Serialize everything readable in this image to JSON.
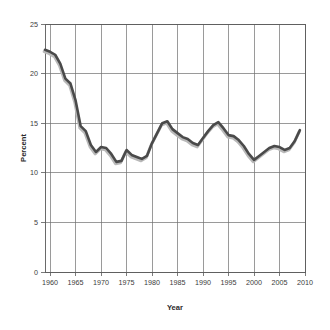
{
  "chart_data": {
    "type": "line",
    "title": "",
    "xlabel": "Year",
    "ylabel": "Percent",
    "xlim": [
      1959,
      2010
    ],
    "ylim": [
      0,
      25
    ],
    "grid": true,
    "legend": null,
    "legend_position": "none",
    "line_color": "#4a4a4a",
    "shadow_color": "#b9b9b9",
    "xticks": [
      "1960",
      "1965",
      "1970",
      "1975",
      "1980",
      "1985",
      "1990",
      "1995",
      "2000",
      "2005",
      "2010"
    ],
    "xtick_values": [
      1960,
      1965,
      1970,
      1975,
      1980,
      1985,
      1990,
      1995,
      2000,
      2005,
      2010
    ],
    "yticks": [
      "0",
      "5",
      "10",
      "15",
      "20",
      "25"
    ],
    "ytick_values": [
      0,
      5,
      10,
      15,
      20,
      25
    ],
    "series": [
      {
        "name": "Percent",
        "x": [
          1959,
          1960,
          1961,
          1962,
          1963,
          1964,
          1965,
          1966,
          1967,
          1968,
          1969,
          1970,
          1971,
          1972,
          1973,
          1974,
          1975,
          1976,
          1977,
          1978,
          1979,
          1980,
          1981,
          1982,
          1983,
          1984,
          1985,
          1986,
          1987,
          1988,
          1989,
          1990,
          1991,
          1992,
          1993,
          1994,
          1995,
          1996,
          1997,
          1998,
          1999,
          2000,
          2001,
          2002,
          2003,
          2004,
          2005,
          2006,
          2007,
          2008,
          2009
        ],
        "values": [
          22.4,
          22.2,
          21.9,
          21.0,
          19.5,
          19.0,
          17.3,
          14.7,
          14.2,
          12.8,
          12.1,
          12.6,
          12.5,
          11.9,
          11.1,
          11.2,
          12.3,
          11.8,
          11.6,
          11.4,
          11.7,
          13.0,
          14.0,
          15.0,
          15.2,
          14.4,
          14.0,
          13.6,
          13.4,
          13.0,
          12.8,
          13.5,
          14.2,
          14.8,
          15.1,
          14.5,
          13.8,
          13.7,
          13.3,
          12.7,
          11.9,
          11.3,
          11.7,
          12.1,
          12.5,
          12.7,
          12.6,
          12.3,
          12.5,
          13.2,
          14.3
        ]
      }
    ]
  },
  "axes": {
    "x_title": "Year",
    "y_title": "Percent"
  }
}
